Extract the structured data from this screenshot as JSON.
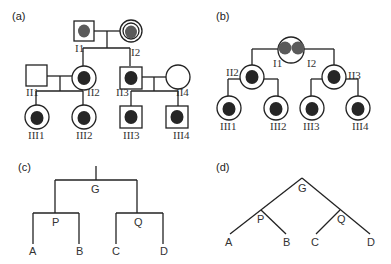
{
  "panels": {
    "a": {
      "label": "(a)",
      "individuals": {
        "I1": "I1",
        "I2": "I2",
        "II1": "II1",
        "II2": "II2",
        "II3": "II3",
        "II4": "II4",
        "III1": "III1",
        "III2": "III2",
        "III3": "III3",
        "III4": "III4"
      }
    },
    "b": {
      "label": "(b)",
      "individuals": {
        "I1": "I1",
        "I2": "I2",
        "II2": "II2",
        "II3": "II3",
        "III1": "III1",
        "III2": "III2",
        "III3": "III3",
        "III4": "III4"
      }
    },
    "c": {
      "label": "(c)",
      "nodes": {
        "root": "G",
        "left": "P",
        "right": "Q",
        "a": "A",
        "b": "B",
        "c": "C",
        "d": "D"
      }
    },
    "d": {
      "label": "(d)",
      "nodes": {
        "root": "G",
        "left": "P",
        "right": "Q",
        "a": "A",
        "b": "B",
        "c": "C",
        "d": "D"
      }
    }
  },
  "colors": {
    "line": "#222222",
    "affected": "#262626",
    "carrier": "#5a5a5a",
    "background": "#ffffff"
  }
}
